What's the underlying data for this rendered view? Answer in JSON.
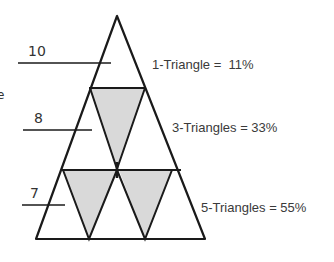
{
  "figure": {
    "type": "triangle-subdivision-diagram",
    "colors": {
      "stroke": "#1a1a1a",
      "shade": "#d9d9d9",
      "background": "#ffffff"
    },
    "left_labels": [
      {
        "text": "10",
        "row": 1
      },
      {
        "text": "8",
        "row": 2
      },
      {
        "text": "7",
        "row": 3
      }
    ],
    "right_labels": [
      {
        "text": "1-Triangle =  11%",
        "row": 1
      },
      {
        "text": "3-Triangles = 33%",
        "row": 2
      },
      {
        "text": "5-Triangles = 55%",
        "row": 3
      }
    ],
    "partial_left_text": "e",
    "rows": [
      {
        "row": 1,
        "upright_triangles": 1,
        "shaded_inverted_triangles": 0,
        "percent": "11%"
      },
      {
        "row": 2,
        "upright_triangles": 2,
        "shaded_inverted_triangles": 1,
        "percent": "33%"
      },
      {
        "row": 3,
        "upright_triangles": 3,
        "shaded_inverted_triangles": 2,
        "percent": "55%"
      }
    ]
  }
}
